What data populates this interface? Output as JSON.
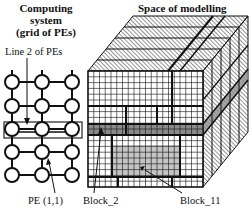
{
  "left_panel": {
    "title_line1": "Computing system",
    "title_line2": "(grid of PEs)",
    "line_label": "Line 2 of PEs",
    "pe_label": "PE (1,1)",
    "grid": {
      "columns": 3,
      "rows": 5,
      "highlighted_row": 3
    }
  },
  "right_panel": {
    "title": "Space of modelling",
    "block2_label": "Block_2",
    "block11_label": "Block_11",
    "cube": {
      "front_columns": 20,
      "front_rows": 20,
      "depth_layers": 5
    }
  },
  "colors": {
    "line": "#111111",
    "block2_fill": "#8a8a8a",
    "block11_fill": "#c4c4c4",
    "background": "#ffffff"
  }
}
